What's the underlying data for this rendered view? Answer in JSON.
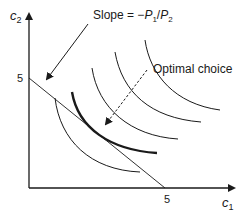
{
  "diagram": {
    "type": "consumer-choice-indifference-curves",
    "y_axis": {
      "label": "c",
      "subscript": "2",
      "tick_label": "5"
    },
    "x_axis": {
      "label": "c",
      "subscript": "1",
      "tick_label": "5"
    },
    "annotations": {
      "slope": {
        "prefix": "Slope = −",
        "p1": "P",
        "p1_sub": "1",
        "slash": "/",
        "p2": "P",
        "p2_sub": "2"
      },
      "optimal": {
        "text": "Optimal choice"
      }
    },
    "budget_line": {
      "from": [
        0,
        5
      ],
      "to": [
        5,
        0
      ]
    },
    "indifference_curves": 4,
    "colors": {
      "ink": "#1a1a1a",
      "background": "#ffffff"
    }
  }
}
